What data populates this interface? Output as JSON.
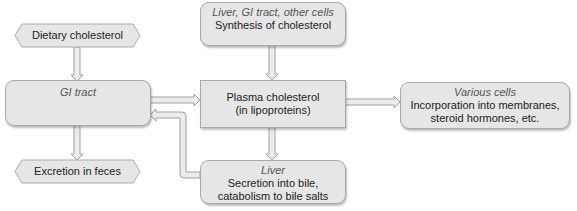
{
  "diagram": {
    "nodes": {
      "dietary": {
        "label": "Dietary cholesterol"
      },
      "gi": {
        "location": "GI tract",
        "label": ""
      },
      "synthesis": {
        "location": "Liver, GI tract, other cells",
        "label": "Synthesis of cholesterol"
      },
      "plasma": {
        "line1": "Plasma cholesterol",
        "line2": "(in lipoproteins)"
      },
      "various": {
        "location": "Various cells",
        "line1": "Incorporation into membranes,",
        "line2": "steroid hormones, etc."
      },
      "excretion": {
        "label": "Excretion in feces"
      },
      "liver": {
        "location": "Liver",
        "line1": "Secretion into bile,",
        "line2": "catabolism to bile salts"
      }
    },
    "edges": [
      {
        "from": "dietary",
        "to": "gi"
      },
      {
        "from": "gi",
        "to": "plasma"
      },
      {
        "from": "synthesis",
        "to": "plasma"
      },
      {
        "from": "plasma",
        "to": "various"
      },
      {
        "from": "plasma",
        "to": "liver"
      },
      {
        "from": "gi",
        "to": "excretion"
      },
      {
        "from": "liver",
        "to": "gi"
      }
    ],
    "colors": {
      "box_fill": "#e6e6e6",
      "box_border": "#a9a9a9",
      "arrow_fill": "#e8e8e8",
      "arrow_stroke": "#a0a0a0"
    }
  }
}
